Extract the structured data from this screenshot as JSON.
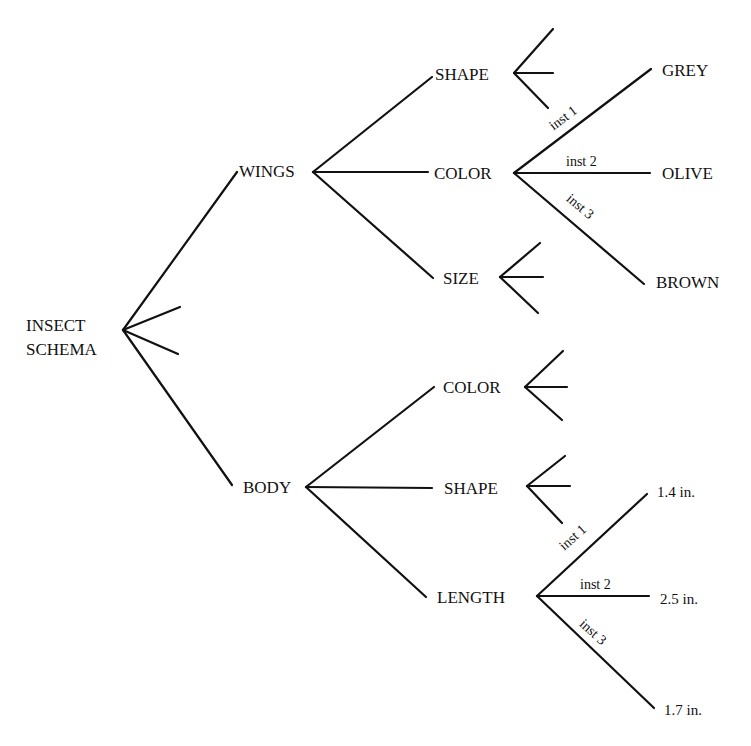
{
  "diagram": {
    "root": {
      "label_line1": "INSECT",
      "label_line2": "SCHEMA"
    },
    "level1": [
      {
        "id": "wings",
        "label": "WINGS"
      },
      {
        "id": "body",
        "label": "BODY"
      }
    ],
    "wings_children": [
      {
        "id": "wings-shape",
        "label": "SHAPE"
      },
      {
        "id": "wings-color",
        "label": "COLOR"
      },
      {
        "id": "wings-size",
        "label": "SIZE"
      }
    ],
    "body_children": [
      {
        "id": "body-color",
        "label": "COLOR"
      },
      {
        "id": "body-shape",
        "label": "SHAPE"
      },
      {
        "id": "body-length",
        "label": "LENGTH"
      }
    ],
    "wings_color_instances": [
      {
        "edge": "inst 1",
        "value": "GREY"
      },
      {
        "edge": "inst 2",
        "value": "OLIVE"
      },
      {
        "edge": "inst 3",
        "value": "BROWN"
      }
    ],
    "body_length_instances": [
      {
        "edge": "inst 1",
        "value": "1.4 in."
      },
      {
        "edge": "inst 2",
        "value": "2.5 in."
      },
      {
        "edge": "inst 3",
        "value": "1.7 in."
      }
    ],
    "line_color": "#111111"
  }
}
